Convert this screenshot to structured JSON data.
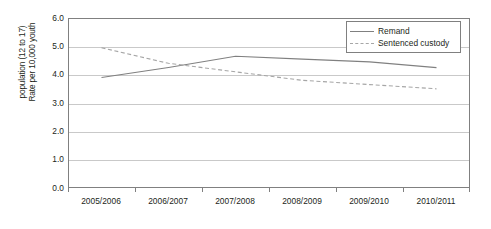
{
  "chart_data": {
    "type": "line",
    "title": "",
    "xlabel": "",
    "ylabel": "Rate per 10,000 youth population (12 to 17)",
    "ylabel_line1": "Rate per 10,000 youth",
    "ylabel_line2": "population (12 to 17)",
    "categories": [
      "2005/2006",
      "2006/2007",
      "2007/2008",
      "2008/2009",
      "2009/2010",
      "2010/2011"
    ],
    "series": [
      {
        "name": "Remand",
        "style": "solid",
        "color": "#808080",
        "values": [
          3.9,
          4.25,
          4.65,
          4.55,
          4.45,
          4.25
        ]
      },
      {
        "name": "Sentenced custody",
        "style": "dashed",
        "color": "#a6a6a6",
        "values": [
          4.95,
          4.4,
          4.1,
          3.8,
          3.65,
          3.5
        ]
      }
    ],
    "ylim": [
      0.0,
      6.0
    ],
    "ytick_values": [
      6.0,
      5.0,
      4.0,
      3.0,
      2.0,
      1.0,
      0.0
    ],
    "ytick_labels": [
      "6.0",
      "5.0",
      "4.0",
      "3.0",
      "2.0",
      "1.0",
      "0.0"
    ],
    "grid": true,
    "grid_axis": "y",
    "legend_position": "top-right",
    "legend_entries": [
      "Remand",
      "Sentenced custody"
    ]
  },
  "colors": {
    "remand": "#808080",
    "sentenced_custody": "#a6a6a6",
    "gridline": "#c9c9c9",
    "frame": "#808080",
    "text": "#231f20",
    "background": "#ffffff"
  }
}
